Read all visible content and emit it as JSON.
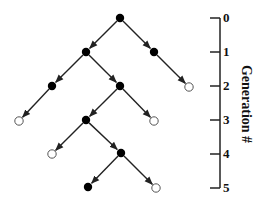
{
  "colors": {
    "line": "#222222",
    "filled_node": "#000000",
    "open_node_stroke": "#555555",
    "open_node_fill": "#ffffff"
  },
  "axis": {
    "title": "Generation #",
    "ticks": [
      {
        "label": "0",
        "y": 18
      },
      {
        "label": "1",
        "y": 52
      },
      {
        "label": "2",
        "y": 86
      },
      {
        "label": "3",
        "y": 120
      },
      {
        "label": "4",
        "y": 154
      },
      {
        "label": "5",
        "y": 188
      }
    ]
  },
  "tree": {
    "nodes": [
      {
        "id": "n0",
        "gen": 0,
        "x": 120,
        "y": 18,
        "filled": true
      },
      {
        "id": "n1a",
        "gen": 1,
        "x": 86,
        "y": 52,
        "filled": true
      },
      {
        "id": "n1b",
        "gen": 1,
        "x": 154,
        "y": 52,
        "filled": true
      },
      {
        "id": "n2a",
        "gen": 2,
        "x": 52,
        "y": 86,
        "filled": true
      },
      {
        "id": "n2b",
        "gen": 2,
        "x": 120,
        "y": 86,
        "filled": true
      },
      {
        "id": "n2c",
        "gen": 2,
        "x": 189,
        "y": 87,
        "filled": false
      },
      {
        "id": "n3a",
        "gen": 3,
        "x": 19,
        "y": 121,
        "filled": false
      },
      {
        "id": "n3b",
        "gen": 3,
        "x": 86,
        "y": 120,
        "filled": true
      },
      {
        "id": "n3c",
        "gen": 3,
        "x": 154,
        "y": 121,
        "filled": false
      },
      {
        "id": "n4a",
        "gen": 4,
        "x": 52,
        "y": 154,
        "filled": false
      },
      {
        "id": "n4b",
        "gen": 4,
        "x": 121,
        "y": 153,
        "filled": true
      },
      {
        "id": "n5a",
        "gen": 5,
        "x": 88,
        "y": 187,
        "filled": true
      },
      {
        "id": "n5b",
        "gen": 5,
        "x": 156,
        "y": 188,
        "filled": false
      }
    ],
    "edges": [
      [
        "n0",
        "n1a"
      ],
      [
        "n0",
        "n1b"
      ],
      [
        "n1a",
        "n2a"
      ],
      [
        "n1a",
        "n2b"
      ],
      [
        "n1b",
        "n2c"
      ],
      [
        "n2a",
        "n3a"
      ],
      [
        "n2b",
        "n3b"
      ],
      [
        "n2b",
        "n3c"
      ],
      [
        "n3b",
        "n4a"
      ],
      [
        "n3b",
        "n4b"
      ],
      [
        "n4b",
        "n5a"
      ],
      [
        "n4b",
        "n5b"
      ]
    ]
  }
}
